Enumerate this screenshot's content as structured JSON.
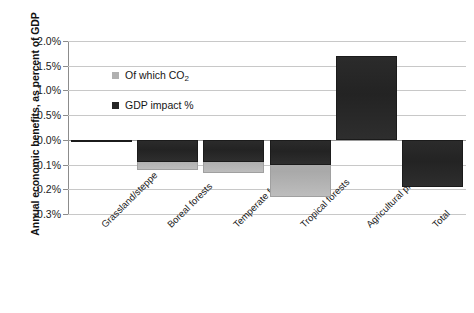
{
  "chart_data": {
    "type": "bar",
    "title": "",
    "xlabel": "",
    "ylabel": "Annual economic benefits, as percent of GDP",
    "ylim": [
      -0.3,
      2.0
    ],
    "yticks": [
      "2.0%",
      "1.5%",
      "1.0%",
      "0.5%",
      "0.0%",
      "-0.1%",
      "-0.2%",
      "-0.3%"
    ],
    "ytick_values": [
      2.0,
      1.5,
      1.0,
      0.5,
      0.0,
      -0.1,
      -0.2,
      -0.3
    ],
    "grid": true,
    "legend_position": "inside-upper-left",
    "categories": [
      "Grassland/steppe",
      "Boreal forests",
      "Temperate forests",
      "Tropical forests",
      "Agricultural production",
      "Total"
    ],
    "series": [
      {
        "name": "GDP impact %",
        "color": "#262626",
        "values": [
          -0.01,
          -0.09,
          -0.09,
          -0.1,
          1.7,
          -0.19
        ]
      },
      {
        "name": "Of which CO2",
        "color": "#b0b0b0",
        "values": [
          0.0,
          -0.12,
          -0.135,
          -0.23,
          0.0,
          0.0
        ]
      }
    ]
  },
  "legend": {
    "items": [
      {
        "label_prefix": "Of which CO",
        "label_sub": "2",
        "swatch": "co2"
      },
      {
        "label_prefix": "GDP impact %",
        "label_sub": "",
        "swatch": "gdp"
      }
    ]
  }
}
